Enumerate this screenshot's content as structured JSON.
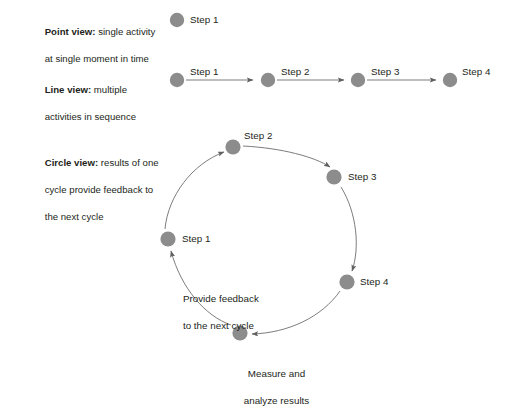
{
  "diagram": {
    "title_hidden": "",
    "node_color": "#8c8c8c",
    "line_color": "#6d6d6d",
    "text_color": "#231f20",
    "rows": [
      {
        "id": "point-view",
        "label_bold": "Point view:",
        "label_rest": " single activity",
        "label_line2": "at single moment in time",
        "nodes": [
          {
            "label": "Step 1"
          }
        ]
      },
      {
        "id": "line-view",
        "label_bold": "Line view:",
        "label_rest": " multiple",
        "label_line2": "activities in sequence",
        "nodes": [
          {
            "label": "Step 1"
          },
          {
            "label": "Step 2"
          },
          {
            "label": "Step 3"
          },
          {
            "label": "Step 4"
          }
        ]
      },
      {
        "id": "circle-view",
        "label_bold": "Circle view:",
        "label_rest": " results of one",
        "label_line2": "cycle provide feedback to",
        "label_line3": "the next cycle",
        "nodes": [
          {
            "label": "Step 1"
          },
          {
            "label": "Step 2"
          },
          {
            "label": "Step 3"
          },
          {
            "label": "Step 4"
          }
        ],
        "captions": [
          {
            "id": "feedback",
            "line1": "Provide feedback",
            "line2": "to the next cycle"
          },
          {
            "id": "measure",
            "line1": "Measure and",
            "line2": "analyze results"
          }
        ]
      }
    ]
  }
}
